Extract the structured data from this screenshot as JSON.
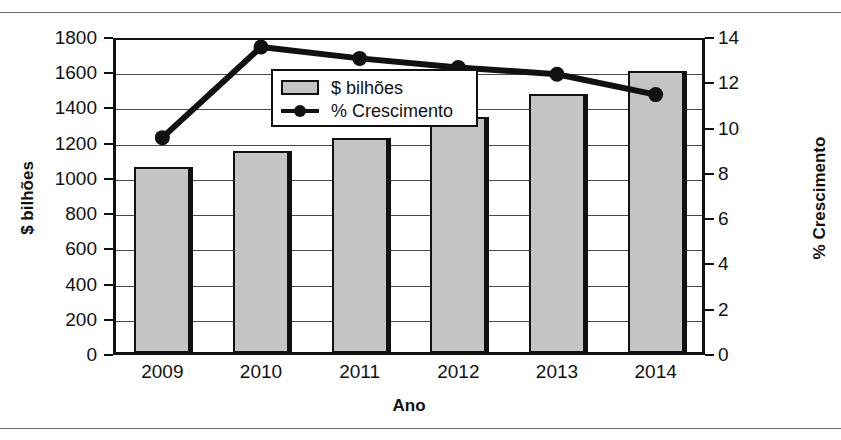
{
  "figure": {
    "clipped_title": "",
    "xlabel": "Ano",
    "ylabel_left": "$ bilhões",
    "ylabel_right": "% Crescimento"
  },
  "legend": {
    "items": [
      {
        "label": "$ bilhões",
        "marker": "bar-swatch",
        "color": "#c4c4c4"
      },
      {
        "label": "% Crescimento",
        "marker": "line-marker",
        "color": "#111111"
      }
    ]
  },
  "chart_data": {
    "type": "bar",
    "title": "",
    "xlabel": "Ano",
    "ylabel": "$ bilhões",
    "y2label": "% Crescimento",
    "categories": [
      "2009",
      "2010",
      "2011",
      "2012",
      "2013",
      "2014"
    ],
    "ylim": [
      0,
      1800
    ],
    "yticks": [
      0,
      200,
      400,
      600,
      800,
      1000,
      1200,
      1400,
      1600,
      1800
    ],
    "ytick_labels": [
      "0",
      "200",
      "400",
      "600",
      "800",
      "1000",
      "1200",
      "1400",
      "1600",
      "1800"
    ],
    "y2lim": [
      0,
      14
    ],
    "y2ticks": [
      0,
      2,
      4,
      6,
      8,
      10,
      12,
      14
    ],
    "y2tick_labels": [
      "0",
      "2",
      "4",
      "6",
      "8",
      "10",
      "12",
      "14"
    ],
    "grid": true,
    "legend_position": "upper center",
    "series": [
      {
        "name": "$ bilhões",
        "type": "bar",
        "axis": "left",
        "color": "#c4c4c4",
        "values": [
          1070,
          1160,
          1230,
          1350,
          1480,
          1615
        ]
      },
      {
        "name": "% Crescimento",
        "type": "line",
        "axis": "right",
        "color": "#111111",
        "values": [
          9.6,
          13.6,
          13.1,
          12.7,
          12.4,
          11.5
        ]
      }
    ]
  }
}
